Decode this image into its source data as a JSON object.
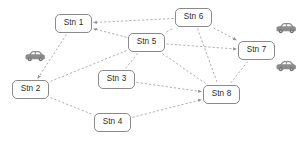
{
  "diagram": {
    "background_color": "#ffffff",
    "node_border_color": "#8a8a8a",
    "node_fill_color": "#ffffff",
    "node_text_color": "#2b2b2b",
    "edge_color": "#9a9a9a",
    "edge_style": "dashed",
    "car_color": "#8c8c8c",
    "nodes": [
      {
        "id": "stn1",
        "label": "Stn 1",
        "x": 55,
        "y": 14,
        "w": 37,
        "h": 19
      },
      {
        "id": "stn2",
        "label": "Stn 2",
        "x": 12,
        "y": 80,
        "w": 37,
        "h": 19
      },
      {
        "id": "stn3",
        "label": "Stn 3",
        "x": 98,
        "y": 70,
        "w": 37,
        "h": 19
      },
      {
        "id": "stn4",
        "label": "Stn 4",
        "x": 94,
        "y": 113,
        "w": 37,
        "h": 19
      },
      {
        "id": "stn5",
        "label": "Stn 5",
        "x": 128,
        "y": 33,
        "w": 37,
        "h": 19
      },
      {
        "id": "stn6",
        "label": "Stn 6",
        "x": 175,
        "y": 8,
        "w": 37,
        "h": 19
      },
      {
        "id": "stn7",
        "label": "Stn 7",
        "x": 238,
        "y": 41,
        "w": 37,
        "h": 19
      },
      {
        "id": "stn8",
        "label": "Stn 8",
        "x": 203,
        "y": 85,
        "w": 37,
        "h": 19
      }
    ],
    "edges": [
      {
        "from": "stn5",
        "to": "stn1",
        "arrow": true
      },
      {
        "from": "stn6",
        "to": "stn1",
        "arrow": true
      },
      {
        "from": "stn1",
        "to": "stn2",
        "arrow": true
      },
      {
        "from": "stn2",
        "to": "stn4",
        "arrow": false
      },
      {
        "from": "stn4",
        "to": "stn8",
        "arrow": true
      },
      {
        "from": "stn2",
        "to": "stn5",
        "arrow": false
      },
      {
        "from": "stn5",
        "to": "stn3",
        "arrow": false
      },
      {
        "from": "stn3",
        "to": "stn8",
        "arrow": true
      },
      {
        "from": "stn5",
        "to": "stn6",
        "arrow": false
      },
      {
        "from": "stn5",
        "to": "stn7",
        "arrow": true
      },
      {
        "from": "stn5",
        "to": "stn8",
        "arrow": false
      },
      {
        "from": "stn6",
        "to": "stn7",
        "arrow": true
      },
      {
        "from": "stn6",
        "to": "stn8",
        "arrow": false
      },
      {
        "from": "stn7",
        "to": "stn8",
        "arrow": false
      }
    ],
    "cars": [
      {
        "id": "car-left",
        "x": 24,
        "y": 48,
        "w": 22,
        "h": 12
      },
      {
        "id": "car-top-right",
        "x": 275,
        "y": 20,
        "w": 22,
        "h": 12
      },
      {
        "id": "car-bottom-right",
        "x": 275,
        "y": 58,
        "w": 22,
        "h": 12
      }
    ]
  }
}
